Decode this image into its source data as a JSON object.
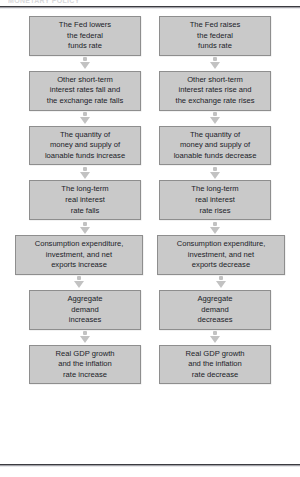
{
  "figure": {
    "running_header": "MONETARY POLICY",
    "columns": [
      {
        "id": "expansionary",
        "name": "left-column"
      },
      {
        "id": "contractionary",
        "name": "right-column"
      }
    ],
    "rows": [
      {
        "width": "narrow",
        "left": [
          "The Fed lowers",
          "the federal",
          "funds rate"
        ],
        "right": [
          "The Fed raises",
          "the federal",
          "funds rate"
        ]
      },
      {
        "width": "narrow",
        "left": [
          "Other short-term",
          "interest rates fall and",
          "the exchange rate falls"
        ],
        "right": [
          "Other short-term",
          "interest rates rise and",
          "the exchange rate rises"
        ]
      },
      {
        "width": "narrow",
        "left": [
          "The quantity of",
          "money and supply of",
          "loanable funds increase"
        ],
        "right": [
          "The quantity of",
          "money and supply of",
          "loanable funds decrease"
        ]
      },
      {
        "width": "narrow",
        "left": [
          "The long-term",
          "real interest",
          "rate falls"
        ],
        "right": [
          "The long-term",
          "real interest",
          "rate rises"
        ]
      },
      {
        "width": "wide",
        "left": [
          "Consumption expenditure,",
          "investment, and net",
          "exports increase"
        ],
        "right": [
          "Consumption expenditure,",
          "investment, and net",
          "exports decrease"
        ]
      },
      {
        "width": "narrow",
        "left": [
          "Aggregate",
          "demand",
          "increases"
        ],
        "right": [
          "Aggregate",
          "demand",
          "decreases"
        ]
      },
      {
        "width": "narrow",
        "left": [
          "Real GDP growth",
          "and the inflation",
          "rate increase"
        ],
        "right": [
          "Real GDP growth",
          "and the inflation",
          "rate decrease"
        ]
      }
    ],
    "colors": {
      "box_fill": "#c9c9c9",
      "box_border": "#8e8e8e",
      "text": "#1b1c28",
      "arrow": "#c2c2c2",
      "rule": "#3b3b40",
      "page": "#ffffff"
    }
  }
}
